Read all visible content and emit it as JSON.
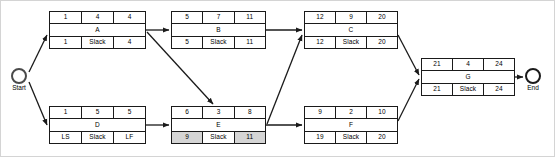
{
  "diagram": {
    "type": "project-network-diagram",
    "column_headers": [
      "early_start",
      "duration",
      "early_finish",
      "late_start",
      "slack",
      "late_finish"
    ],
    "slack_label": "Slack",
    "nodes": [
      {
        "id": "A",
        "name": "A",
        "top": [
          "1",
          "4",
          "4"
        ],
        "bottom": [
          "1",
          "Slack",
          "4"
        ],
        "shaded": [
          false,
          false,
          false
        ],
        "x": 48,
        "y": 10,
        "w": 97,
        "h": 38
      },
      {
        "id": "B",
        "name": "B",
        "top": [
          "5",
          "7",
          "11"
        ],
        "bottom": [
          "5",
          "Slack",
          "11"
        ],
        "shaded": [
          false,
          false,
          false
        ],
        "x": 170,
        "y": 10,
        "w": 95,
        "h": 38
      },
      {
        "id": "C",
        "name": "C",
        "top": [
          "12",
          "9",
          "20"
        ],
        "bottom": [
          "12",
          "Slack",
          "20"
        ],
        "shaded": [
          false,
          false,
          false
        ],
        "x": 303,
        "y": 10,
        "w": 94,
        "h": 38
      },
      {
        "id": "D",
        "name": "D",
        "top": [
          "1",
          "5",
          "5"
        ],
        "bottom": [
          "LS",
          "Slack",
          "LF"
        ],
        "shaded": [
          false,
          false,
          false
        ],
        "x": 48,
        "y": 105,
        "w": 97,
        "h": 38
      },
      {
        "id": "E",
        "name": "E",
        "top": [
          "6",
          "3",
          "8"
        ],
        "bottom": [
          "9",
          "Slack",
          "11"
        ],
        "shaded": [
          true,
          false,
          true
        ],
        "x": 170,
        "y": 105,
        "w": 95,
        "h": 38
      },
      {
        "id": "F",
        "name": "F",
        "top": [
          "9",
          "2",
          "10"
        ],
        "bottom": [
          "19",
          "Slack",
          "20"
        ],
        "shaded": [
          false,
          false,
          false
        ],
        "x": 303,
        "y": 105,
        "w": 94,
        "h": 38
      },
      {
        "id": "G",
        "name": "G",
        "top": [
          "21",
          "4",
          "24"
        ],
        "bottom": [
          "21",
          "Slack",
          "24"
        ],
        "shaded": [
          false,
          false,
          false
        ],
        "x": 420,
        "y": 57,
        "w": 94,
        "h": 38
      }
    ],
    "terminals": [
      {
        "id": "start",
        "label": "Start",
        "x": 10,
        "y": 67
      },
      {
        "id": "end",
        "label": "End",
        "x": 524,
        "y": 67
      }
    ],
    "edges": [
      {
        "from": "start",
        "to": "A"
      },
      {
        "from": "start",
        "to": "D"
      },
      {
        "from": "A",
        "to": "B"
      },
      {
        "from": "A",
        "to": "E"
      },
      {
        "from": "B",
        "to": "C"
      },
      {
        "from": "E",
        "to": "C"
      },
      {
        "from": "D",
        "to": "E"
      },
      {
        "from": "E",
        "to": "F"
      },
      {
        "from": "C",
        "to": "G"
      },
      {
        "from": "F",
        "to": "G"
      },
      {
        "from": "G",
        "to": "end"
      }
    ],
    "colors": {
      "stroke": "#1a1a1a",
      "shaded_cell": "#d5d5d5",
      "background": "#ffffff",
      "frame": "#d4d4d4"
    }
  }
}
